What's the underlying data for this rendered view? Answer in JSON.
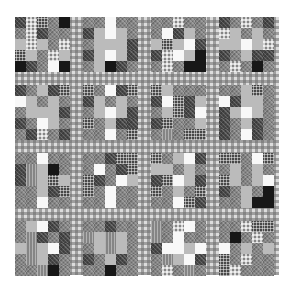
{
  "image": {
    "subject": "Patchwork quilt photographed in black and white",
    "layout": {
      "rows": 4,
      "cols": 4,
      "patches_per_block_side": 5,
      "sashing": "gingham check"
    },
    "colors": {
      "background": "#ffffff",
      "sashing_light": "#d8d8d8",
      "sashing_dark": "#6e6e6e",
      "patch_white": "#f2f2f2",
      "patch_light": "#b8b8b8",
      "patch_mid": "#858585",
      "patch_dark": "#4a4a4a",
      "patch_black": "#1c1c1c"
    },
    "blocks": [
      {
        "pattern": "DCKMBMCDMMLCLMCKLMCLBDMWB"
      },
      {
        "pattern": "MMWMMDLWLMMLLLDDLWLDMLBDM"
      },
      {
        "pattern": "MMCMMMWDLMLKLWDDCWLBMCMBB"
      },
      {
        "pattern": "DMCMDCLMLMLLWLCDMLDDMCMBM"
      },
      {
        "pattern": "DMLDKWLMLMMLLLDDMWLMMDCMD"
      },
      {
        "pattern": "KMWDKDLMLMMLWLDKMLDDMMWMK"
      },
      {
        "pattern": "KLMMMDWKDLMLKDWDKMMLMSMKK"
      },
      {
        "pattern": "MMLKMWDLLMDLWLMDMLDMDMWDM"
      },
      {
        "pattern": "MMWMMDSLBMDSLKLMMLDKMMWMM"
      },
      {
        "pattern": "MMDKKMWMDKKDMWLKMWMMMMWMM"
      },
      {
        "pattern": "KMLWDLLMLMDKWLDKMLMKMMWKD"
      },
      {
        "pattern": "KKMWKMLMLMKLMLWDMLMBMMLBB"
      },
      {
        "pattern": "MLWDMMSDMDLSLWDMSLDMMMSBM"
      },
      {
        "pattern": "MMDMMSLSLMMLSLMDMLDMMMBMM"
      },
      {
        "pattern": "SMCWMSMWMMDWWLWMSLWDMCMSM"
      },
      {
        "pattern": "MMCKKMBMCMWMLMLKMCMMKCMMM"
      }
    ],
    "pattern_legend": {
      "W": "white patch",
      "L": "light gray patch",
      "M": "medium gray print",
      "D": "dark print",
      "B": "black solid",
      "C": "check fabric",
      "K": "dotted print",
      "S": "striped print"
    }
  }
}
